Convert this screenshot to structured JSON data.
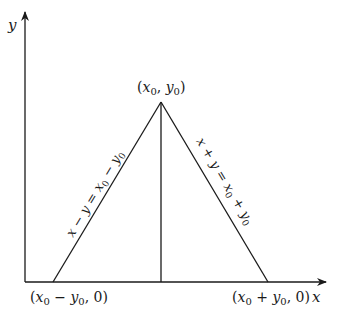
{
  "diagram": {
    "axes": {
      "x_label": "x",
      "y_label": "y"
    },
    "points": {
      "apex": {
        "label": "(x0, y0)",
        "x_var": "x",
        "x_sub": "0",
        "y_var": "y",
        "y_sub": "0"
      },
      "left_base": {
        "label": "(x0 − y0, 0)"
      },
      "right_base": {
        "label": "(x0 + y0, 0)"
      }
    },
    "lines": {
      "left_edge": {
        "equation": "x − y = x0 − y0"
      },
      "right_edge": {
        "equation": "x + y = x0 + y0"
      },
      "altitude": {
        "from": "(x0, y0)",
        "to": "(x0, 0)"
      }
    },
    "colors": {
      "stroke": "#1a1a1a",
      "background": "#ffffff"
    }
  }
}
